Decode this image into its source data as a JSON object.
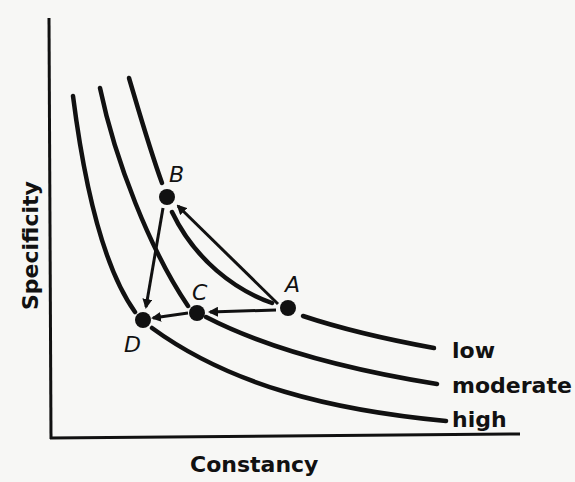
{
  "axes": {
    "x_label": "Constancy",
    "y_label": "Specificity"
  },
  "curves": [
    {
      "name": "low",
      "label": "low"
    },
    {
      "name": "moderate",
      "label": "moderate"
    },
    {
      "name": "high",
      "label": "high"
    }
  ],
  "points": [
    {
      "id": "A",
      "label": "A"
    },
    {
      "id": "B",
      "label": "B"
    },
    {
      "id": "C",
      "label": "C"
    },
    {
      "id": "D",
      "label": "D"
    }
  ],
  "arrows": [
    {
      "from": "A",
      "to": "B"
    },
    {
      "from": "A",
      "to": "C"
    },
    {
      "from": "C",
      "to": "D"
    },
    {
      "from": "B",
      "to": "D"
    }
  ],
  "colors": {
    "ink": "#111111",
    "background": "#f7f7f5"
  }
}
